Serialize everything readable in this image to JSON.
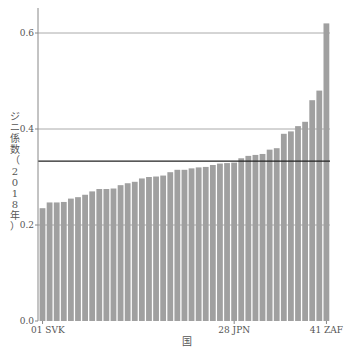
{
  "chart_data": {
    "type": "bar",
    "title": "",
    "xlabel": "国",
    "ylabel": "ジニ係数（2018年）",
    "ylim": [
      0,
      0.63
    ],
    "yticks": [
      0.0,
      0.2,
      0.4,
      0.6
    ],
    "ytick_labels": [
      "0.0",
      "0.2",
      "0.4",
      "0.6"
    ],
    "grid": "horizontal at 0.2, 0.4, 0.6",
    "xtick_positions": [
      1,
      28,
      41
    ],
    "xtick_labels": [
      "01 SVK",
      "28 JPN",
      "41 ZAF"
    ],
    "reference_line": {
      "label": "mean",
      "value": 0.333
    },
    "categories": [
      "01 SVK",
      "02",
      "03",
      "04",
      "05",
      "06",
      "07",
      "08",
      "09",
      "10",
      "11",
      "12",
      "13",
      "14",
      "15",
      "16",
      "17",
      "18",
      "19",
      "20",
      "21",
      "22",
      "23",
      "24",
      "25",
      "26",
      "27",
      "28 JPN",
      "29",
      "30",
      "31",
      "32",
      "33",
      "34",
      "35",
      "36",
      "37",
      "38",
      "39",
      "40",
      "41 ZAF"
    ],
    "values": [
      0.235,
      0.247,
      0.247,
      0.248,
      0.255,
      0.258,
      0.263,
      0.27,
      0.275,
      0.275,
      0.276,
      0.283,
      0.287,
      0.29,
      0.297,
      0.3,
      0.301,
      0.303,
      0.31,
      0.315,
      0.315,
      0.318,
      0.32,
      0.321,
      0.325,
      0.328,
      0.329,
      0.33,
      0.339,
      0.344,
      0.346,
      0.348,
      0.357,
      0.36,
      0.39,
      0.395,
      0.406,
      0.415,
      0.46,
      0.48,
      0.62
    ],
    "colors": {
      "bar": "#a0a0a0",
      "grid": "#aaaaaa",
      "reference": "#222222",
      "axis": "#888888"
    }
  }
}
